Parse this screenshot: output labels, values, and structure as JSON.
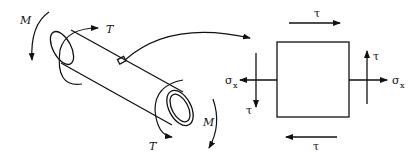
{
  "diagram": {
    "type": "stress-element",
    "shaft": {
      "labels": {
        "moment_left": "M",
        "moment_right": "M",
        "torque_left": "T",
        "torque_right": "T"
      }
    },
    "element": {
      "labels": {
        "tau_top": "τ",
        "tau_bottom": "τ",
        "tau_left": "τ",
        "tau_right": "τ",
        "sigma_left": "σ",
        "sigma_left_sub": "x",
        "sigma_right": "σ",
        "sigma_right_sub": "x"
      }
    },
    "colors": {
      "stroke": "#111111",
      "background": "#ffffff"
    }
  }
}
